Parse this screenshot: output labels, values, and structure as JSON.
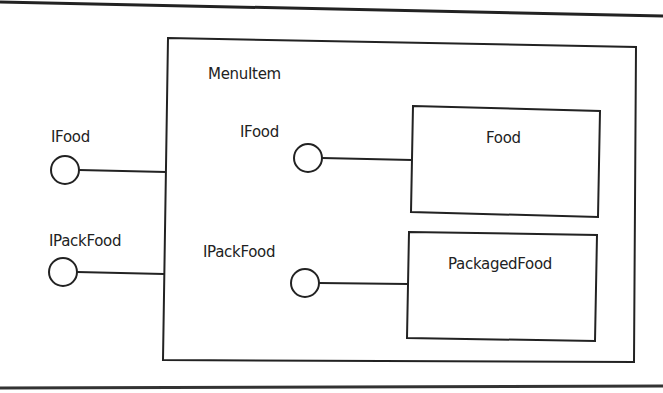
{
  "diagram": {
    "type": "UML component diagram",
    "container": {
      "label": "MenuItem"
    },
    "external_interfaces": [
      {
        "label": "IFood"
      },
      {
        "label": "IPackFood"
      }
    ],
    "internal_interfaces": [
      {
        "label": "IFood"
      },
      {
        "label": "IPackFood"
      }
    ],
    "components": [
      {
        "label": "Food"
      },
      {
        "label": "PackagedFood"
      }
    ],
    "colors": {
      "stroke": "#222222",
      "background": "#ffffff"
    }
  }
}
